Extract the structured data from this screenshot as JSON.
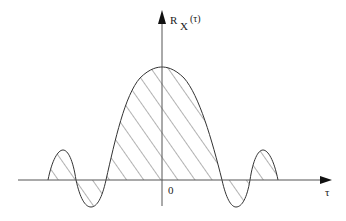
{
  "figure": {
    "type": "autocorrelation-function-sketch",
    "y_axis_label_main": "R",
    "y_axis_label_sub": "X",
    "y_axis_label_arg": "(τ)",
    "x_axis_label": "τ",
    "origin_label": "0",
    "curve": "damped oscillating even function with hatched area under curve",
    "hatch": "diagonal lines",
    "colors": {
      "line": "#333333",
      "hatch": "#555555",
      "background": "#ffffff"
    }
  }
}
